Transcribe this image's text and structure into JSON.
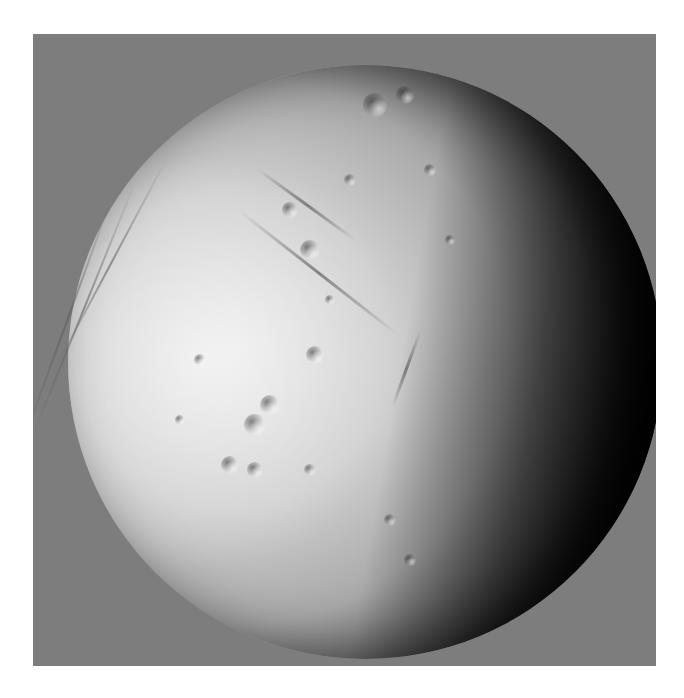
{
  "image": {
    "subject": "icy moon surface (Enceladus-like) with cratered terrain and linear grooves",
    "background_color": "#ffffff",
    "frame_color": "#7d7d7d",
    "moon": {
      "lit_color": "#e6e6e6",
      "mid_color": "#a9a9a9",
      "shadow_color": "#000000",
      "light_direction": "left"
    },
    "features": {
      "craters": [
        {
          "x": 310,
          "y": 250,
          "r": 10
        },
        {
          "x": 290,
          "y": 210,
          "r": 8
        },
        {
          "x": 375,
          "y": 105,
          "r": 12
        },
        {
          "x": 405,
          "y": 95,
          "r": 9
        },
        {
          "x": 270,
          "y": 405,
          "r": 10
        },
        {
          "x": 255,
          "y": 425,
          "r": 11
        },
        {
          "x": 315,
          "y": 355,
          "r": 9
        },
        {
          "x": 230,
          "y": 465,
          "r": 9
        },
        {
          "x": 255,
          "y": 470,
          "r": 8
        },
        {
          "x": 310,
          "y": 470,
          "r": 6
        },
        {
          "x": 390,
          "y": 520,
          "r": 6
        },
        {
          "x": 200,
          "y": 360,
          "r": 6
        },
        {
          "x": 430,
          "y": 170,
          "r": 6
        },
        {
          "x": 450,
          "y": 240,
          "r": 5
        },
        {
          "x": 350,
          "y": 180,
          "r": 6
        },
        {
          "x": 180,
          "y": 420,
          "r": 5
        },
        {
          "x": 330,
          "y": 300,
          "r": 5
        },
        {
          "x": 410,
          "y": 560,
          "r": 6
        }
      ],
      "grooves": [
        {
          "x": 258,
          "y": 168,
          "len": 120,
          "angle": 36
        },
        {
          "x": 240,
          "y": 210,
          "len": 200,
          "angle": 38
        },
        {
          "x": 420,
          "y": 330,
          "len": 80,
          "angle": 110
        }
      ],
      "limb_grooves": [
        {
          "x": 110,
          "y": 200,
          "len": 260,
          "angle": 20
        },
        {
          "x": 135,
          "y": 180,
          "len": 280,
          "angle": 22
        },
        {
          "x": 165,
          "y": 160,
          "len": 240,
          "angle": 28
        }
      ]
    }
  }
}
